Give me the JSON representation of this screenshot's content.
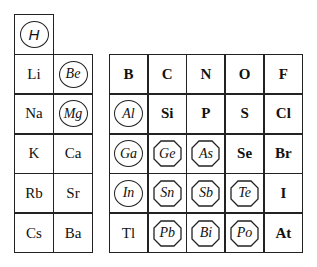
{
  "legend_markers": {
    "circle": "circled symbol",
    "octagon": "octagon-framed symbol"
  },
  "top": {
    "symbol": "H",
    "marker": "circle"
  },
  "left_block": {
    "rows": [
      [
        {
          "symbol": "Li",
          "marker": "none"
        },
        {
          "symbol": "Be",
          "marker": "circle"
        }
      ],
      [
        {
          "symbol": "Na",
          "marker": "none"
        },
        {
          "symbol": "Mg",
          "marker": "circle"
        }
      ],
      [
        {
          "symbol": "K",
          "marker": "none"
        },
        {
          "symbol": "Ca",
          "marker": "none"
        }
      ],
      [
        {
          "symbol": "Rb",
          "marker": "none"
        },
        {
          "symbol": "Sr",
          "marker": "none"
        }
      ],
      [
        {
          "symbol": "Cs",
          "marker": "none"
        },
        {
          "symbol": "Ba",
          "marker": "none"
        }
      ]
    ]
  },
  "right_block": {
    "rows": [
      [
        {
          "symbol": "B",
          "marker": "bold"
        },
        {
          "symbol": "C",
          "marker": "bold"
        },
        {
          "symbol": "N",
          "marker": "bold"
        },
        {
          "symbol": "O",
          "marker": "bold"
        },
        {
          "symbol": "F",
          "marker": "bold"
        }
      ],
      [
        {
          "symbol": "Al",
          "marker": "circle"
        },
        {
          "symbol": "Si",
          "marker": "bold"
        },
        {
          "symbol": "P",
          "marker": "bold"
        },
        {
          "symbol": "S",
          "marker": "bold"
        },
        {
          "symbol": "Cl",
          "marker": "bold"
        }
      ],
      [
        {
          "symbol": "Ga",
          "marker": "circle"
        },
        {
          "symbol": "Ge",
          "marker": "octagon"
        },
        {
          "symbol": "As",
          "marker": "octagon"
        },
        {
          "symbol": "Se",
          "marker": "bold"
        },
        {
          "symbol": "Br",
          "marker": "bold"
        }
      ],
      [
        {
          "symbol": "In",
          "marker": "circle"
        },
        {
          "symbol": "Sn",
          "marker": "octagon"
        },
        {
          "symbol": "Sb",
          "marker": "octagon"
        },
        {
          "symbol": "Te",
          "marker": "octagon"
        },
        {
          "symbol": "I",
          "marker": "bold"
        }
      ],
      [
        {
          "symbol": "Tl",
          "marker": "none"
        },
        {
          "symbol": "Pb",
          "marker": "octagon"
        },
        {
          "symbol": "Bi",
          "marker": "octagon"
        },
        {
          "symbol": "Po",
          "marker": "octagon"
        },
        {
          "symbol": "At",
          "marker": "bold"
        }
      ]
    ]
  }
}
